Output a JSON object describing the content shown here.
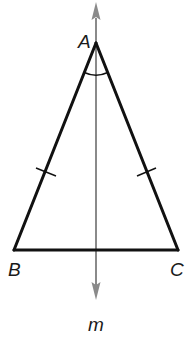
{
  "figure": {
    "type": "isosceles triangle with line of symmetry",
    "vertices": {
      "A": "A",
      "B": "B",
      "C": "C"
    },
    "line_label": "m",
    "congruent_sides": [
      "AB",
      "AC"
    ],
    "angle_mark": "A",
    "colors": {
      "triangle": "#111111",
      "line_m": "#8a8a8a",
      "background": "#ffffff"
    }
  }
}
